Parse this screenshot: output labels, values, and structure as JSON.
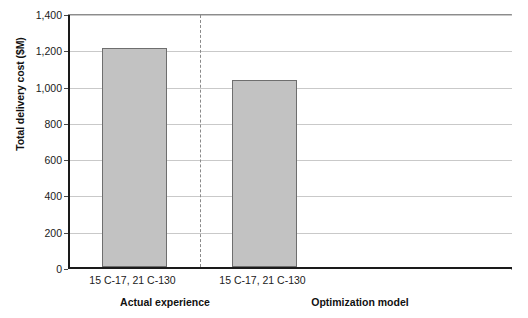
{
  "chart_data": {
    "type": "bar",
    "title": "",
    "subtitle": "",
    "xlabel": "",
    "ylabel": "Total delivery cost ($M)",
    "ylim": [
      0,
      1400
    ],
    "ytick_values": [
      0,
      200,
      400,
      600,
      800,
      1000,
      1200,
      1400
    ],
    "ytick_labels": [
      "0",
      "200",
      "400",
      "600",
      "800",
      "1,000",
      "1,200",
      "1,400"
    ],
    "grid": true,
    "legend": "none",
    "categories": [
      "15 C-17, 21 C-130",
      "15 C-17, 21 C-130"
    ],
    "values": [
      1205,
      1030
    ],
    "groups": [
      "Actual experience",
      "Optimization model"
    ],
    "bars": [
      {
        "group": "Actual experience",
        "category": "15 C-17, 21 C-130",
        "value": 1205
      },
      {
        "group": "Optimization model",
        "category": "15 C-17, 21 C-130",
        "value": 1030
      }
    ],
    "annotations": [
      {
        "kind": "vertical-dashed-divider",
        "description": "dashed line separating Actual experience from Optimization model"
      }
    ],
    "colors": {
      "bar_fill": "#c2c2c2",
      "bar_stroke": "#6e6e6e",
      "axis": "#1a1a1a",
      "gridline": "#c9c9c9",
      "divider": "#8a8a8a",
      "text": "#1a1a1a",
      "background": "#ffffff"
    }
  }
}
